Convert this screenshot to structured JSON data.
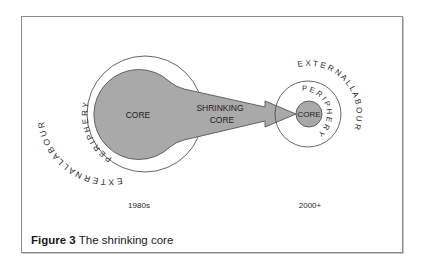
{
  "figure": {
    "caption_number": "Figure 3",
    "caption_text": " The shrinking core"
  },
  "left_diagram": {
    "era_label": "1980s",
    "core_label": "CORE",
    "periphery_label": "P E R I P H E R Y",
    "external_label": "E X T E R N A L   L A B O U R"
  },
  "arrow": {
    "label_line1": "SHRINKING",
    "label_line2": "CORE"
  },
  "right_diagram": {
    "era_label": "2000+",
    "core_label": "CORE",
    "periphery_label": "P E R I P H E R Y",
    "external_label": "E X T E R N A L   L A B O U R"
  },
  "colors": {
    "core_fill": "#a9a9a9",
    "outline": "#555555",
    "frame_border": "#8a8a8a"
  }
}
